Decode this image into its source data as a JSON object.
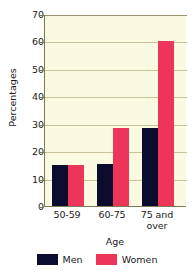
{
  "chart_data": {
    "type": "bar",
    "title": "",
    "xlabel": "Age",
    "ylabel": "Percentages",
    "categories": [
      "50-59",
      "60-75",
      "75 and over"
    ],
    "series": [
      {
        "name": "Men",
        "values": [
          15,
          15.5,
          28.5
        ],
        "color": "#0b0b2e"
      },
      {
        "name": "Women",
        "values": [
          15,
          28.5,
          60
        ],
        "color": "#ed3559"
      }
    ],
    "ylim": [
      0,
      70
    ],
    "ytick_values": [
      0,
      10,
      20,
      30,
      40,
      50,
      60,
      70
    ],
    "ytick_labels": [
      "0",
      "10",
      "20",
      "30",
      "40",
      "50",
      "60",
      "70"
    ],
    "grid": true,
    "legend_position": "bottom",
    "plot_background": "#fafae2",
    "gridline_color": "#c9c39a",
    "axis_color": "#7d7a52"
  },
  "axes": {
    "y_label": "Percentages",
    "x_label": "Age",
    "y_ticks": [
      {
        "label": "70",
        "value": 70
      },
      {
        "label": "60",
        "value": 60
      },
      {
        "label": "50",
        "value": 50
      },
      {
        "label": "40",
        "value": 40
      },
      {
        "label": "30",
        "value": 30
      },
      {
        "label": "20",
        "value": 20
      },
      {
        "label": "10",
        "value": 10
      },
      {
        "label": "0",
        "value": 0
      }
    ],
    "x_ticks": [
      {
        "line1": "50-59",
        "line2": ""
      },
      {
        "line1": "60-75",
        "line2": ""
      },
      {
        "line1": "75 and",
        "line2": "over"
      }
    ]
  },
  "legend": {
    "items": [
      {
        "label": "Men",
        "color": "#0b0b2e"
      },
      {
        "label": "Women",
        "color": "#ed3559"
      }
    ]
  },
  "caption": {
    "fragment": ""
  }
}
